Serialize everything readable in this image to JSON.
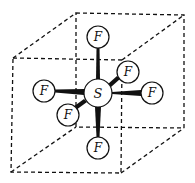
{
  "diagram": {
    "central_atom": {
      "label": "S",
      "x": 98,
      "y": 93,
      "r": 14
    },
    "ligands": [
      {
        "label": "F",
        "position": "top",
        "x": 98,
        "y": 37,
        "r": 11
      },
      {
        "label": "F",
        "position": "back-right",
        "x": 128,
        "y": 72,
        "r": 11
      },
      {
        "label": "F",
        "position": "right",
        "x": 152,
        "y": 93,
        "r": 11
      },
      {
        "label": "F",
        "position": "left",
        "x": 44,
        "y": 91,
        "r": 11
      },
      {
        "label": "F",
        "position": "front-left",
        "x": 68,
        "y": 115,
        "r": 11
      },
      {
        "label": "F",
        "position": "bottom",
        "x": 98,
        "y": 148,
        "r": 11
      }
    ],
    "cube": {
      "front": [
        [
          13,
          58
        ],
        [
          122,
          60
        ],
        [
          121,
          173
        ],
        [
          11,
          172
        ]
      ],
      "back": [
        [
          76,
          13
        ],
        [
          184,
          15
        ],
        [
          184,
          128
        ],
        [
          76,
          127
        ]
      ],
      "line_style": "dashed"
    }
  }
}
